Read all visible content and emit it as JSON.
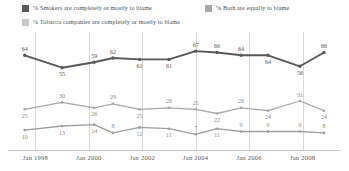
{
  "legend": {
    "items": [
      {
        "id": "smokers",
        "label": "% Smokers are completely or mostly to blame",
        "color": "#595959"
      },
      {
        "id": "both",
        "label": "% Both are equally to blame",
        "color": "#a8a8a8"
      },
      {
        "id": "tobacco",
        "label": "% Tobacco companies are completely or mostly to blame",
        "color": "#c9c9c9"
      }
    ]
  },
  "axis": {
    "ticks": [
      "Jan 1998",
      "Jan 2000",
      "Jan 2002",
      "Jan 2004",
      "Jan 2006",
      "Jan 2008"
    ]
  },
  "chart_data": {
    "type": "line",
    "title": "",
    "xlabel": "",
    "ylabel": "",
    "ylim": [
      0,
      75
    ],
    "grid": true,
    "legend_position": "top",
    "x": [
      1997.6,
      1999.0,
      2000.2,
      2000.9,
      2001.9,
      2003.0,
      2004.0,
      2004.8,
      2005.7,
      2006.7,
      2007.9,
      2008.8
    ],
    "tick_values": [
      1998,
      2000,
      2002,
      2004,
      2006,
      2008
    ],
    "tick_labels": [
      "Jan 1998",
      "Jan 2000",
      "Jan 2002",
      "Jan 2004",
      "Jan 2006",
      "Jan 2008"
    ],
    "series": [
      {
        "name": "% Smokers are completely or mostly to blame",
        "color": "#595959",
        "values": [
          64,
          55,
          59,
          62,
          61,
          61,
          67,
          66,
          64,
          64,
          56,
          66
        ]
      },
      {
        "name": "% Both are equally to blame",
        "color": "#a8a8a8",
        "values": [
          25,
          30,
          26,
          29,
          25,
          26,
          25,
          22,
          26,
          24,
          31,
          24
        ]
      },
      {
        "name": "% Tobacco companies are completely or mostly to blame",
        "color": "#9e9e9e",
        "values": [
          10,
          13,
          14,
          8,
          12,
          11,
          7,
          11,
          9,
          9,
          9,
          8
        ]
      }
    ]
  }
}
